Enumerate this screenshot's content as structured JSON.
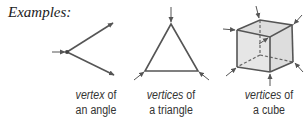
{
  "heading": "Examples:",
  "examples": [
    {
      "term": "vertex",
      "connector": " of",
      "object": "an angle"
    },
    {
      "term": "vertices",
      "connector": " of",
      "object": "a triangle"
    },
    {
      "term": "vertices",
      "connector": " of",
      "object": "a cube"
    }
  ],
  "colors": {
    "line": "#555555",
    "cube_fill": "#dcdcdc",
    "text": "#333333"
  }
}
